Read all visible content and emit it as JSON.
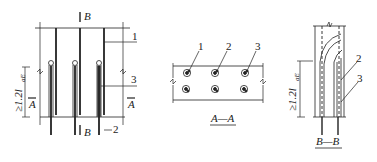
{
  "figure": {
    "elevation": {
      "section_mark_top": "B",
      "section_mark_bottom": "B",
      "section_mark_left": "A",
      "section_mark_right": "A",
      "dimension_label": "≥1.2l",
      "dimension_subscript": "aE",
      "callouts": [
        "1",
        "2",
        "3"
      ]
    },
    "section_aa": {
      "title": "A—A",
      "callouts": [
        "1",
        "2",
        "3"
      ]
    },
    "section_bb": {
      "title": "B—B",
      "dimension_label": "≥1.2l",
      "dimension_subscript": "aE",
      "callouts": [
        "2",
        "3"
      ]
    }
  },
  "colors": {
    "line": "#222222",
    "bar_fill": "#7a7a7a",
    "background": "#ffffff"
  }
}
